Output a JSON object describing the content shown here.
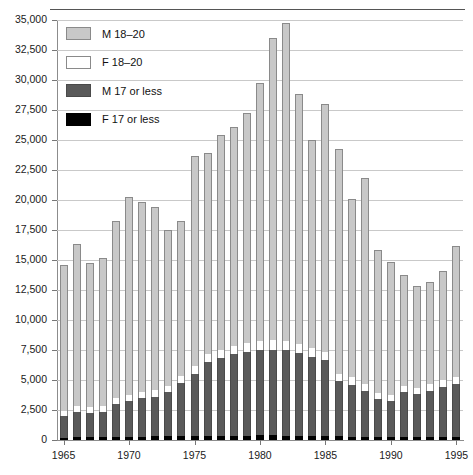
{
  "chart_data": {
    "type": "bar",
    "subtype": "stacked-bar",
    "title": "",
    "subtitle": "",
    "xlabel": "",
    "ylabel": "",
    "ylim": [
      0,
      35000
    ],
    "ytick_values": [
      0,
      2500,
      5000,
      7500,
      10000,
      12500,
      15000,
      17500,
      20000,
      22500,
      25000,
      27500,
      30000,
      32500,
      35000
    ],
    "ytick_labels": [
      "0",
      "2,500",
      "5,000",
      "7,500",
      "10,000",
      "12,500",
      "15,000",
      "17,500",
      "20,000",
      "22,500",
      "25,000",
      "27,500",
      "30,000",
      "32,500",
      "35,000"
    ],
    "grid": true,
    "legend_position": "upper-left",
    "categories": [
      1965,
      1966,
      1967,
      1968,
      1969,
      1970,
      1971,
      1972,
      1973,
      1974,
      1975,
      1976,
      1977,
      1978,
      1979,
      1980,
      1981,
      1982,
      1983,
      1984,
      1985,
      1986,
      1987,
      1988,
      1989,
      1990,
      1991,
      1992,
      1993,
      1994,
      1995
    ],
    "xtick_labels": [
      "1965",
      "1970",
      "1975",
      "1980",
      "1985",
      "1990",
      "1995"
    ],
    "xtick_values": [
      1965,
      1970,
      1975,
      1980,
      1985,
      1990,
      1995
    ],
    "series": [
      {
        "name": "F 17 or less",
        "color": "#000000",
        "values": [
          200,
          220,
          220,
          230,
          250,
          260,
          280,
          300,
          320,
          330,
          340,
          350,
          360,
          370,
          370,
          380,
          380,
          370,
          360,
          350,
          330,
          300,
          270,
          250,
          230,
          220,
          210,
          210,
          220,
          230,
          250
        ]
      },
      {
        "name": "M 17 or less",
        "color": "#5a5a5a",
        "values": [
          1800,
          2100,
          2050,
          2100,
          2750,
          3000,
          3200,
          3300,
          3650,
          4400,
          5200,
          6150,
          6450,
          6800,
          7000,
          7150,
          7150,
          7100,
          6900,
          6600,
          6300,
          4600,
          4350,
          3850,
          3200,
          3050,
          3800,
          3600,
          3900,
          4200,
          4450
        ]
      },
      {
        "name": "F 18–20",
        "color": "#ffffff",
        "values": [
          450,
          480,
          470,
          470,
          500,
          520,
          540,
          540,
          560,
          580,
          620,
          650,
          680,
          700,
          720,
          750,
          770,
          760,
          740,
          720,
          700,
          620,
          600,
          560,
          520,
          500,
          520,
          520,
          540,
          560,
          580
        ]
      },
      {
        "name": "M 18–20",
        "color": "#c8c8c8",
        "values": [
          12100,
          13550,
          12000,
          12400,
          14750,
          16450,
          15800,
          15300,
          13000,
          12950,
          17500,
          16750,
          17900,
          18200,
          19200,
          21500,
          25200,
          26500,
          20800,
          17300,
          20700,
          18700,
          14900,
          17200,
          11900,
          11050,
          9200,
          8500,
          8500,
          9100,
          10900
        ]
      }
    ],
    "totals": [
      14550,
      16350,
      14740,
      15200,
      18250,
      20230,
      19820,
      19440,
      17530,
      18260,
      23660,
      23900,
      25390,
      26070,
      27290,
      29780,
      33500,
      34730,
      28800,
      24970,
      24030,
      24220,
      20120,
      21860,
      15850,
      14820,
      13730,
      12830,
      13160,
      14090,
      16180
    ]
  },
  "legend": {
    "items": [
      {
        "label": "M  18–20",
        "swatch": "light-gray-swatch"
      },
      {
        "label": "F  18–20",
        "swatch": "white-swatch"
      },
      {
        "label": "M  17 or less",
        "swatch": "dark-gray-swatch"
      },
      {
        "label": "F  17 or less",
        "swatch": "black-swatch"
      }
    ]
  },
  "colors": {
    "m_18_20": "#c8c8c8",
    "f_18_20": "#ffffff",
    "m_17_or_less": "#5a5a5a",
    "f_17_or_less": "#000000",
    "gridline": "#c9c9c9",
    "axis": "#8c8c8c"
  }
}
